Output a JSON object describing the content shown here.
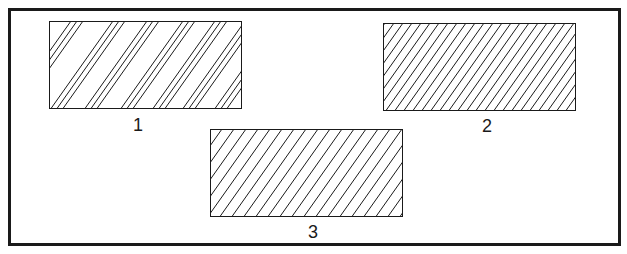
{
  "figure": {
    "border_color": "#1a1a1a",
    "line_color": "#1a1a1a",
    "panels": [
      {
        "label": "1",
        "pattern": "grouped diagonal hatching (clusters of 3 lines)",
        "x": 49,
        "y": 21,
        "width": 192,
        "height": 87
      },
      {
        "label": "2",
        "pattern": "dense uniform diagonal hatching",
        "x": 383,
        "y": 23,
        "width": 192,
        "height": 87
      },
      {
        "label": "3",
        "pattern": "uniform diagonal hatching",
        "x": 210,
        "y": 129,
        "width": 192,
        "height": 87
      }
    ]
  }
}
